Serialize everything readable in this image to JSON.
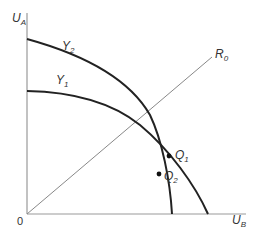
{
  "diagram": {
    "type": "utility possibility frontiers",
    "axes": {
      "y": {
        "label": "U",
        "subscript": "A"
      },
      "x": {
        "label": "U",
        "subscript": "B"
      },
      "origin": "0"
    },
    "curves": [
      {
        "name": "Y",
        "subscript": "2",
        "color": "#222222"
      },
      {
        "name": "Y",
        "subscript": "1",
        "color": "#222222"
      }
    ],
    "ray": {
      "name": "R",
      "subscript": "0",
      "color": "#888888"
    },
    "points": [
      {
        "name": "Q",
        "subscript": "1"
      },
      {
        "name": "Q",
        "subscript": "2"
      }
    ]
  }
}
